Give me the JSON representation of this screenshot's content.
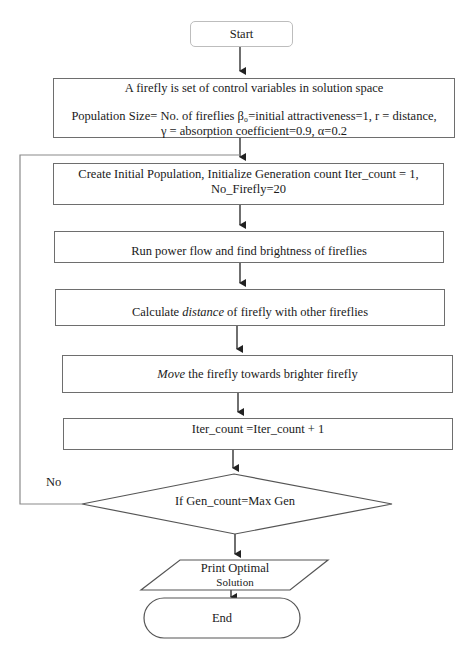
{
  "flowchart": {
    "start": {
      "label": "Start"
    },
    "define": {
      "line1": "A firefly is set of control variables in solution space",
      "line2": "Population Size= No. of fireflies β₀=initial attractiveness=1, r = distance,",
      "line3": "γ = absorption coefficient=0.9, α=0.2"
    },
    "init": {
      "line1": "Create Initial Population, Initialize Generation count Iter_count = 1,",
      "line2": "No_Firefly=20"
    },
    "run": {
      "label": "Run power flow and find brightness of fireflies"
    },
    "calc": {
      "prefix": "Calculate ",
      "emph": "distance",
      "suffix": " of firefly with other fireflies"
    },
    "move": {
      "emph": "Move",
      "suffix": " the firefly towards brighter firefly"
    },
    "iter": {
      "label": "Iter_count =Iter_count + 1"
    },
    "decision": {
      "label": "If Gen_count=Max Gen",
      "no_label": "No"
    },
    "output": {
      "line1": "Print Optimal",
      "line2": "Solution"
    },
    "end": {
      "label": "End"
    }
  },
  "colors": {
    "stroke": "#6e6e6e",
    "start_stroke": "#bdbdbd",
    "arrow": "#222222",
    "text": "#1a1a1a"
  }
}
